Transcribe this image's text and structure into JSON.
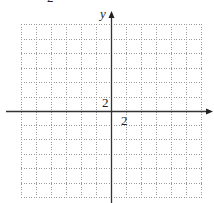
{
  "problem_number_fragment": "2",
  "axes": {
    "x_label": "x",
    "y_label": "y",
    "x_tick_label": "2",
    "y_tick_label": "2",
    "axis_color": "#333333",
    "grid_color": "#9a9a9a"
  },
  "grid": {
    "columns": 12,
    "rows": 12,
    "cell_size_px": 15,
    "units_per_cell": 1,
    "labeled_step": 2,
    "style": "dotted",
    "x_range": [
      -6,
      6
    ],
    "y_range": [
      -6,
      6
    ]
  }
}
